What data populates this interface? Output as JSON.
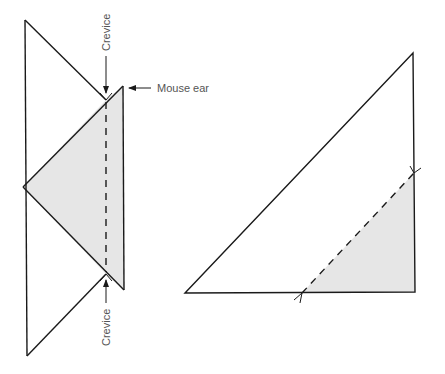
{
  "diagram": {
    "colors": {
      "stroke": "#1a1a1a",
      "fill": "#e6e6e6",
      "label": "#555555",
      "background": "#ffffff"
    },
    "left_figure": {
      "outline_points": [
        [
          25,
          20
        ],
        [
          106,
          100
        ],
        [
          123,
          86
        ],
        [
          124,
          290
        ],
        [
          106,
          274
        ],
        [
          27,
          356
        ]
      ],
      "left_vertex": [
        23,
        187
      ],
      "shaded_region": [
        [
          23,
          187
        ],
        [
          106,
          100
        ],
        [
          123,
          86
        ],
        [
          124,
          290
        ],
        [
          106,
          274
        ]
      ],
      "fold_line": {
        "from": [
          106,
          100
        ],
        "to": [
          106,
          274
        ],
        "style": "dashed"
      },
      "labels": {
        "top_crevice": "Crevice",
        "bottom_crevice": "Crevice",
        "mouse_ear": "Mouse ear"
      }
    },
    "right_figure": {
      "triangle_points": [
        [
          185,
          293
        ],
        [
          413,
          53
        ],
        [
          415,
          292
        ]
      ],
      "shaded_region": [
        [
          302,
          293
        ],
        [
          414,
          173
        ],
        [
          415,
          292
        ]
      ],
      "cut_line": {
        "from": [
          302,
          293
        ],
        "to": [
          414,
          173
        ],
        "style": "dashed"
      }
    }
  }
}
